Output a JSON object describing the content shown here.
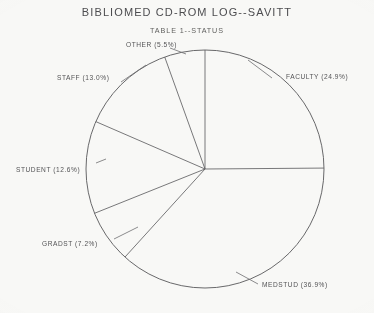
{
  "chart_title": "BIBLIOMED CD-ROM LOG--SAVITT",
  "chart_subtitle": "TABLE 1--STATUS",
  "chart_data": {
    "type": "pie",
    "title": "BIBLIOMED CD-ROM LOG--SAVITT",
    "subtitle": "TABLE 1--STATUS",
    "xlabel": "",
    "ylabel": "",
    "grid": false,
    "legend": "none",
    "label_format": "NAME (P%)",
    "start_angle_deg": 90,
    "direction": "clockwise",
    "categories": [
      "FACULTY",
      "MEDSTUD",
      "GRADST",
      "STUDENT",
      "STAFF",
      "OTHER"
    ],
    "values": [
      24.9,
      36.9,
      7.2,
      12.6,
      13.0,
      5.5
    ],
    "units": "percent",
    "slices": [
      {
        "name": "FACULTY",
        "percent": 24.9,
        "label": "FACULTY (24.9%)",
        "label_x": 286,
        "label_y": 73,
        "leader_x1": 272,
        "leader_y1": 78,
        "leader_x2": 248,
        "leader_y2": 60
      },
      {
        "name": "MEDSTUD",
        "percent": 36.9,
        "label": "MEDSTUD (36.9%)",
        "label_x": 262,
        "label_y": 281,
        "leader_x1": 258,
        "leader_y1": 284,
        "leader_x2": 236,
        "leader_y2": 272
      },
      {
        "name": "GRADST",
        "percent": 7.2,
        "label": "GRADST (7.2%)",
        "label_x": 42,
        "label_y": 240,
        "leader_x1": 114,
        "leader_y1": 239,
        "leader_x2": 138,
        "leader_y2": 227
      },
      {
        "name": "STUDENT",
        "percent": 12.6,
        "label": "STUDENT (12.6%)",
        "label_x": 16,
        "label_y": 166,
        "leader_x1": 96,
        "leader_y1": 163,
        "leader_x2": 106,
        "leader_y2": 159
      },
      {
        "name": "STAFF",
        "percent": 13.0,
        "label": "STAFF (13.0%)",
        "label_x": 57,
        "label_y": 74,
        "leader_x1": 121,
        "leader_y1": 82,
        "leader_x2": 146,
        "leader_y2": 65
      },
      {
        "name": "OTHER",
        "percent": 5.5,
        "label": "OTHER (5.5%)",
        "label_x": 126,
        "label_y": 41,
        "leader_x1": 170,
        "leader_y1": 48,
        "leader_x2": 186,
        "leader_y2": 54
      }
    ],
    "geometry": {
      "center_x": 205,
      "center_y": 169,
      "radius": 119
    },
    "colors": {
      "line": "#5c5c5e",
      "text": "#4e4e50",
      "background": "#fcfcfa"
    }
  }
}
